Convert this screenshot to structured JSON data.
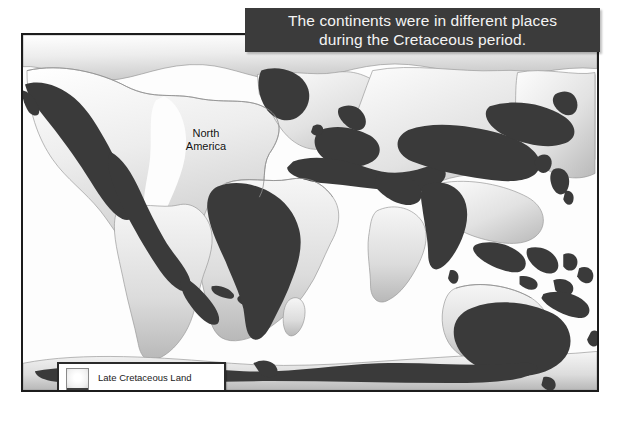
{
  "caption": {
    "text": "The continents were in different places\nduring the Cretaceous period."
  },
  "map": {
    "labels": [
      {
        "id": "north-america",
        "text": "North\nAmerica"
      }
    ]
  },
  "legend": {
    "items": [
      {
        "label": "Late Cretaceous Land",
        "swatch": "light"
      },
      {
        "label": "Land Today",
        "swatch": "dark"
      }
    ]
  },
  "colors": {
    "caption_background": "#3b3b3b",
    "caption_text": "#f4f4f4",
    "land_today": "#3a3a3a",
    "cretaceous_land": "#d8d8d8",
    "ocean": "#fdfdfd",
    "border": "#1c1c1c"
  }
}
